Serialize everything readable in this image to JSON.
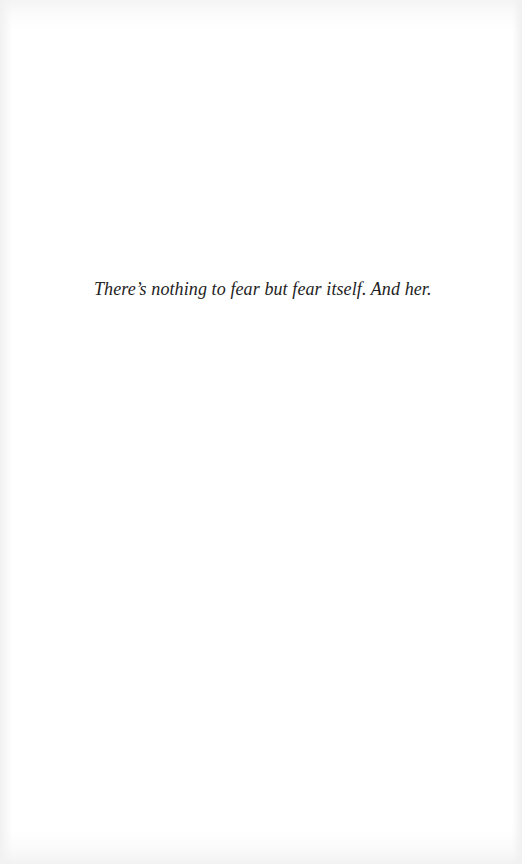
{
  "page": {
    "epigraph": "There’s nothing to fear but fear itself. And her."
  }
}
